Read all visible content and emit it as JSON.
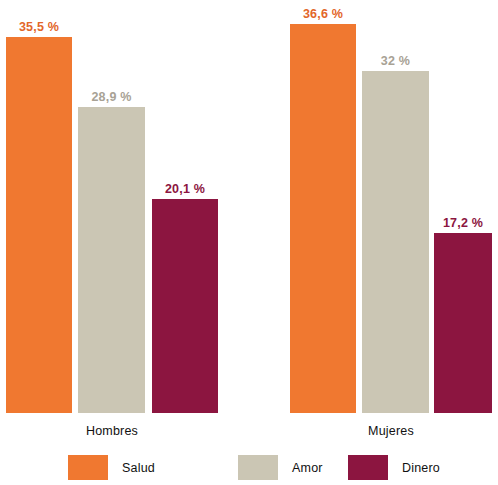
{
  "chart_data": {
    "type": "bar",
    "title": "",
    "subtitle": "",
    "xlabel": "",
    "ylabel": "",
    "categories": [
      "Hombres",
      "Mujeres"
    ],
    "series": [
      {
        "name": "Salud",
        "color": "#F07830",
        "values": [
          35.5,
          36.6
        ],
        "labels": [
          "35,5 %",
          "36,6 %"
        ]
      },
      {
        "name": "Amor",
        "color": "#CBC6B4",
        "values": [
          28.9,
          32.0
        ],
        "labels": [
          "28,9 %",
          "32 %"
        ]
      },
      {
        "name": "Dinero",
        "color": "#8C1540",
        "values": [
          20.1,
          17.2
        ],
        "labels": [
          "20,1 %",
          "17,2 %"
        ]
      }
    ],
    "ylim": [
      0,
      40
    ],
    "grid": false,
    "legend_position": "bottom"
  },
  "bars": [
    {
      "group": "Hombres",
      "series": "Salud",
      "label": "35,5 %",
      "value": 35.5,
      "x": 6,
      "width": 66,
      "height": 376,
      "color": "#F07830",
      "label_class": "val-salud"
    },
    {
      "group": "Hombres",
      "series": "Amor",
      "label": "28,9 %",
      "value": 28.9,
      "x": 78,
      "width": 67,
      "height": 306,
      "color": "#CBC6B4",
      "label_class": "val-amor"
    },
    {
      "group": "Hombres",
      "series": "Dinero",
      "label": "20,1 %",
      "value": 20.1,
      "x": 152,
      "width": 66,
      "height": 214,
      "color": "#8C1540",
      "label_class": "val-dinero"
    },
    {
      "group": "Mujeres",
      "series": "Salud",
      "label": "36,6 %",
      "value": 36.6,
      "x": 290,
      "width": 66,
      "height": 389,
      "color": "#F07830",
      "label_class": "val-salud"
    },
    {
      "group": "Mujeres",
      "series": "Amor",
      "label": "32 %",
      "value": 32.0,
      "x": 362,
      "width": 67,
      "height": 342,
      "color": "#CBC6B4",
      "label_class": "val-amor"
    },
    {
      "group": "Mujeres",
      "series": "Dinero",
      "label": "17,2 %",
      "value": 17.2,
      "x": 434,
      "width": 58,
      "height": 180,
      "color": "#8C1540",
      "label_class": "val-dinero"
    }
  ],
  "group_labels": [
    {
      "text": "Hombres",
      "x": 112,
      "y": 424
    },
    {
      "text": "Mujeres",
      "x": 391,
      "y": 424
    }
  ],
  "legend": {
    "items": [
      {
        "label": "Salud",
        "color": "#F07830",
        "x": 68
      },
      {
        "label": "Amor",
        "color": "#CBC6B4",
        "x": 238
      },
      {
        "label": "Dinero",
        "color": "#8C1540",
        "x": 348
      }
    ]
  }
}
